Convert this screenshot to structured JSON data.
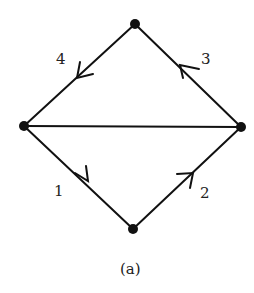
{
  "diagram": {
    "caption": "(a)",
    "nodes": [
      {
        "id": "top",
        "x": 135,
        "y": 24
      },
      {
        "id": "left",
        "x": 24,
        "y": 126
      },
      {
        "id": "right",
        "x": 241,
        "y": 127
      },
      {
        "id": "bottom",
        "x": 133,
        "y": 229
      }
    ],
    "edges": [
      {
        "from": "left",
        "to": "bottom",
        "label": "1",
        "directed": true
      },
      {
        "from": "bottom",
        "to": "right",
        "label": "2",
        "directed": true
      },
      {
        "from": "right",
        "to": "top",
        "label": "3",
        "directed": true
      },
      {
        "from": "top",
        "to": "left",
        "label": "4",
        "directed": true
      },
      {
        "from": "left",
        "to": "right",
        "label": "",
        "directed": false
      }
    ],
    "labels": {
      "e1": "1",
      "e2": "2",
      "e3": "3",
      "e4": "4"
    },
    "colors": {
      "stroke": "#111111",
      "node": "#111111"
    }
  }
}
